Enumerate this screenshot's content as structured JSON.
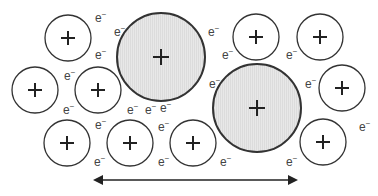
{
  "diagram": {
    "colors": {
      "small_ion_fill": "#ffffff",
      "large_ion_fill": "#e6e6e6",
      "stroke": "#333333",
      "electron_text": "#444444",
      "arrow": "#222222"
    },
    "ion_symbol": "+",
    "electron_symbol": "e",
    "electron_superscript": "−",
    "small_ions": [
      {
        "cx": 68,
        "cy": 38,
        "r": 23
      },
      {
        "cx": 35,
        "cy": 90,
        "r": 23
      },
      {
        "cx": 98,
        "cy": 90,
        "r": 23
      },
      {
        "cx": 256,
        "cy": 37,
        "r": 23
      },
      {
        "cx": 320,
        "cy": 37,
        "r": 23
      },
      {
        "cx": 342,
        "cy": 88,
        "r": 23
      },
      {
        "cx": 67,
        "cy": 143,
        "r": 23
      },
      {
        "cx": 130,
        "cy": 143,
        "r": 23
      },
      {
        "cx": 193,
        "cy": 143,
        "r": 23
      },
      {
        "cx": 323,
        "cy": 142,
        "r": 23
      }
    ],
    "large_ions": [
      {
        "cx": 161,
        "cy": 57,
        "r": 44
      },
      {
        "cx": 257,
        "cy": 108,
        "r": 44
      }
    ],
    "electrons": [
      {
        "x": 95,
        "y": 18
      },
      {
        "x": 114,
        "y": 32
      },
      {
        "x": 95,
        "y": 55
      },
      {
        "x": 64,
        "y": 76
      },
      {
        "x": 63,
        "y": 110
      },
      {
        "x": 127,
        "y": 110
      },
      {
        "x": 145,
        "y": 110
      },
      {
        "x": 95,
        "y": 125
      },
      {
        "x": 160,
        "y": 108
      },
      {
        "x": 158,
        "y": 127
      },
      {
        "x": 158,
        "y": 162
      },
      {
        "x": 208,
        "y": 32
      },
      {
        "x": 222,
        "y": 55
      },
      {
        "x": 209,
        "y": 84
      },
      {
        "x": 286,
        "y": 55
      },
      {
        "x": 305,
        "y": 84
      },
      {
        "x": 220,
        "y": 162
      },
      {
        "x": 286,
        "y": 162
      },
      {
        "x": 359,
        "y": 127
      },
      {
        "x": 94,
        "y": 162
      }
    ],
    "arrow": {
      "x1": 93,
      "x2": 298,
      "y": 180,
      "direction": "double"
    }
  }
}
